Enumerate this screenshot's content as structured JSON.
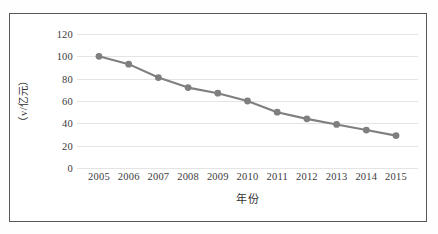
{
  "chart_data": {
    "type": "line",
    "title": "",
    "xlabel": "年份",
    "ylabel": "（v/亿元）",
    "categories": [
      "2005",
      "2006",
      "2007",
      "2008",
      "2009",
      "2010",
      "2011",
      "2012",
      "2013",
      "2014",
      "2015"
    ],
    "x": [
      2005,
      2006,
      2007,
      2008,
      2009,
      2010,
      2011,
      2012,
      2013,
      2014,
      2015
    ],
    "series": [
      {
        "name": "v",
        "values": [
          100,
          93,
          81,
          72,
          67,
          60,
          50,
          44,
          39,
          34,
          29
        ]
      }
    ],
    "ylim": [
      0,
      120
    ],
    "yticks": [
      0,
      20,
      40,
      60,
      80,
      100,
      120
    ],
    "ytick_labels": [
      "0",
      "20",
      "40",
      "60",
      "80",
      "100",
      "120"
    ],
    "grid": true,
    "grid_axis": "y",
    "legend": false,
    "legend_position": "none",
    "marker": "circle",
    "line_color": "#7f7f7f",
    "marker_color": "#7f7f7f",
    "grid_color": "#e4e4e4",
    "frame_color": "#585858",
    "background_color": "#ffffff"
  },
  "axes": {
    "y_title": "（v/亿元）",
    "x_title": "年份"
  }
}
